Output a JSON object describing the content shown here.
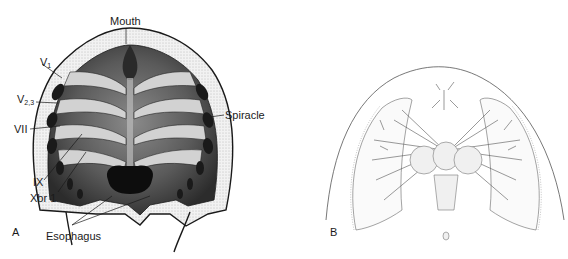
{
  "figure": {
    "panels": [
      {
        "id": "A",
        "letter": "A",
        "labels": {
          "mouth": "Mouth",
          "v1_main": "V",
          "v1_sub": "1",
          "v23_main": "V",
          "v23_sub": "2,3",
          "vii": "VII",
          "spiracle": "Spiracle",
          "ix": "IX",
          "xbr1": "Xbr 1",
          "esophagus": "Esophagus"
        }
      },
      {
        "id": "B",
        "letter": "B"
      }
    ],
    "colors": {
      "ink": "#1a1a1a",
      "stipple_light": "#e6e6e6",
      "stipple_mid": "#9a9a9a",
      "stipple_dark": "#3a3a3a",
      "line_light": "#777777"
    }
  }
}
